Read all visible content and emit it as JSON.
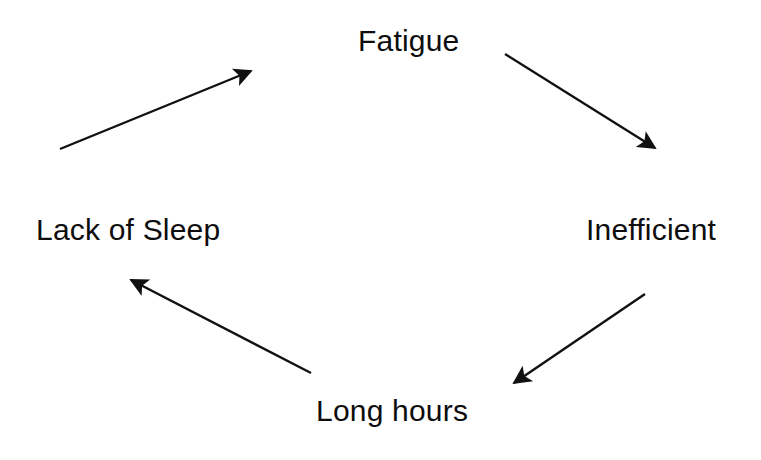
{
  "diagram": {
    "type": "cycle-diagram",
    "background_color": "#ffffff",
    "stroke_color": "#111111",
    "text_color": "#0d0d0d",
    "nodes": [
      {
        "id": "fatigue",
        "label": "Fatigue",
        "position": "top"
      },
      {
        "id": "inefficient",
        "label": "Inefficient",
        "position": "right"
      },
      {
        "id": "long_hours",
        "label": "Long hours",
        "position": "bottom"
      },
      {
        "id": "lack_of_sleep",
        "label": "Lack of Sleep",
        "position": "left"
      }
    ],
    "arrows": [
      {
        "id": "arrow-fatigue-to-inefficient",
        "from": "fatigue",
        "to": "inefficient",
        "direction": "down-right",
        "x1": 505,
        "y1": 54,
        "x2": 659,
        "y2": 151
      },
      {
        "id": "arrow-inefficient-to-long-hours",
        "from": "inefficient",
        "to": "long_hours",
        "direction": "down-left",
        "x1": 645,
        "y1": 294,
        "x2": 509,
        "y2": 386
      },
      {
        "id": "arrow-long-hours-to-lack-of-sleep",
        "from": "long_hours",
        "to": "lack_of_sleep",
        "direction": "up-left",
        "x1": 311,
        "y1": 373,
        "x2": 126,
        "y2": 277
      },
      {
        "id": "arrow-lack-of-sleep-to-fatigue",
        "from": "lack_of_sleep",
        "to": "fatigue",
        "direction": "up-right",
        "x1": 60,
        "y1": 149,
        "x2": 256,
        "y2": 69
      }
    ]
  }
}
